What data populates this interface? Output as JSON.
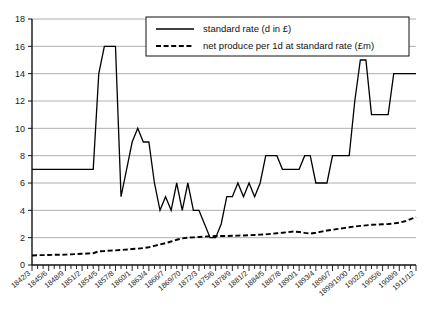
{
  "chart_data": {
    "type": "line",
    "title": "",
    "xlabel": "",
    "ylabel": "",
    "ylim": [
      0,
      18
    ],
    "ytick_step": 2,
    "yticks": [
      "0",
      "2",
      "4",
      "6",
      "8",
      "10",
      "12",
      "14",
      "16",
      "18"
    ],
    "grid": true,
    "legend_position": "top-center",
    "x": [
      "1842/3",
      "1843/4",
      "1844/5",
      "1845/6",
      "1846/7",
      "1847/8",
      "1848/9",
      "1849/50",
      "1850/1",
      "1851/2",
      "1852/3",
      "1853/4",
      "1854/5",
      "1855/6",
      "1856/7",
      "1857/8",
      "1858/9",
      "1859/60",
      "1860/1",
      "1861/2",
      "1862/3",
      "1863/4",
      "1864/5",
      "1865/6",
      "1866/7",
      "1867/8",
      "1868/9",
      "1869/70",
      "1870/1",
      "1871/2",
      "1872/3",
      "1873/4",
      "1874/5",
      "1875/6",
      "1876/7",
      "1877/8",
      "1878/9",
      "1879/80",
      "1880/1",
      "1881/2",
      "1882/3",
      "1883/4",
      "1884/5",
      "1885/6",
      "1886/7",
      "1887/8",
      "1888/9",
      "1889/90",
      "1890/1",
      "1891/2",
      "1892/3",
      "1893/4",
      "1894/5",
      "1895/6",
      "1896/7",
      "1897/8",
      "1898/9",
      "1899/1900",
      "1900/1",
      "1901/2",
      "1902/3",
      "1903/4",
      "1904/5",
      "1905/6",
      "1906/7",
      "1907/8",
      "1908/9",
      "1909/10",
      "1910/11",
      "1911/12"
    ],
    "xtick_labels_every": 3,
    "xtick_labels": [
      "1842/3",
      "1845/6",
      "1848/9",
      "1851/2",
      "1854/5",
      "1857/8",
      "1860/1",
      "1863/4",
      "1866/7",
      "1869/70",
      "1872/3",
      "1875/6",
      "1878/9",
      "1881/2",
      "1884/5",
      "1887/8",
      "1890/1",
      "1893/4",
      "1896/7",
      "1899/1900",
      "1902/3",
      "1905/6",
      "1908/9",
      "1911/12"
    ],
    "series": [
      {
        "name": "standard rate (d in £)",
        "style": "solid",
        "color": "#000000",
        "values": [
          7,
          7,
          7,
          7,
          7,
          7,
          7,
          7,
          7,
          7,
          7,
          7,
          14,
          16,
          16,
          16,
          5,
          7,
          9,
          10,
          9,
          9,
          6,
          4,
          5,
          4,
          6,
          4,
          6,
          4,
          4,
          3,
          2,
          2,
          3,
          5,
          5,
          6,
          5,
          6,
          5,
          6,
          8,
          8,
          8,
          7,
          7,
          7,
          7,
          8,
          8,
          6,
          6,
          6,
          8,
          8,
          8,
          8,
          12,
          15,
          15,
          11,
          11,
          11,
          11,
          14,
          14,
          14,
          14,
          14
        ]
      },
      {
        "name": "net produce per 1d at standard rate (£m)",
        "style": "dashed",
        "color": "#000000",
        "values": [
          0.7,
          0.72,
          0.72,
          0.73,
          0.75,
          0.75,
          0.76,
          0.78,
          0.8,
          0.82,
          0.84,
          0.86,
          1.0,
          1.02,
          1.05,
          1.07,
          1.1,
          1.13,
          1.17,
          1.2,
          1.24,
          1.3,
          1.4,
          1.5,
          1.6,
          1.72,
          1.85,
          1.95,
          2.0,
          2.02,
          2.05,
          2.07,
          2.1,
          2.12,
          2.12,
          2.12,
          2.14,
          2.15,
          2.16,
          2.18,
          2.2,
          2.22,
          2.24,
          2.28,
          2.32,
          2.36,
          2.4,
          2.45,
          2.42,
          2.35,
          2.3,
          2.36,
          2.44,
          2.52,
          2.58,
          2.64,
          2.7,
          2.76,
          2.82,
          2.86,
          2.9,
          2.94,
          2.96,
          2.98,
          3.0,
          3.04,
          3.1,
          3.2,
          3.35,
          3.5
        ]
      }
    ],
    "legend": [
      {
        "label": "standard rate (d in £)",
        "style": "solid"
      },
      {
        "label": "net produce per 1d at standard rate (£m)",
        "style": "dashed"
      }
    ]
  }
}
